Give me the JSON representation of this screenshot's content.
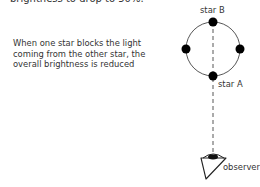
{
  "top_text": "brightness to drop to 50%.",
  "caption": "When one star blocks the light coming from the other star, the overall brightness is reduced",
  "labels": {
    "star_b": "star B",
    "star_a": "star A",
    "observer": "observer"
  },
  "colors": {
    "line": "#333333",
    "star": "#000000",
    "text": "#333333"
  }
}
